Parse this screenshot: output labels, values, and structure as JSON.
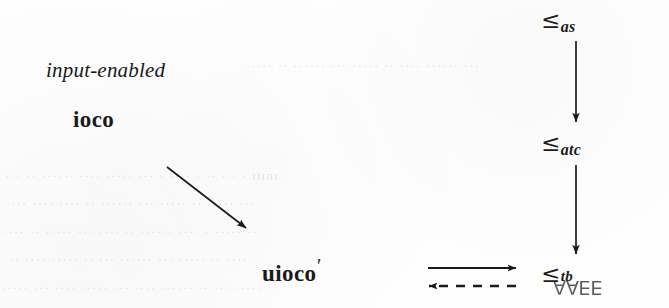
{
  "figure": {
    "background_color": "#fefefe",
    "ink_color": "#1a1a1a",
    "width": 669,
    "height": 308
  },
  "nodes": {
    "input_enabled": "input-enabled",
    "ioco": "ioco",
    "uioco_base": "uioco",
    "uioco_prime": "′"
  },
  "relations": {
    "as": {
      "operator": "≤",
      "subscript": "as"
    },
    "atc": {
      "operator": "≤",
      "subscript": "atc"
    },
    "tb": {
      "operator": "≤",
      "subscript": "tb"
    }
  },
  "artifacts": {
    "quantifier_bleed": "∃∃∀∀",
    "bleed_lines": [
      "  ınıtı · ···  ·· · ···· · ··· ·····  ···· ······ ·· ···",
      " ··· ····· ··  ····· ···  ······ ·· ····  ···· ···",
      "·· ····· · ···· ······ ·· ···· ··· ····· ·· ····",
      " ···· ·· ····· ··· ······ ··· ·· ····· ···· ··",
      "····· ··· ·· ······ ···· ··· ····· ···· ··· ·····",
      " ··· ······ ···· ·· ····· ··· ······ ·· ····"
    ]
  },
  "edges": {
    "ioco_to_uioco": {
      "style": "solid",
      "direction": "down-right"
    },
    "as_to_atc": {
      "style": "solid",
      "direction": "down"
    },
    "atc_to_tb": {
      "style": "solid",
      "direction": "down"
    },
    "uioco_to_tb": {
      "style": "solid",
      "direction": "right"
    },
    "tb_to_uioco": {
      "style": "dashed",
      "direction": "left"
    }
  }
}
